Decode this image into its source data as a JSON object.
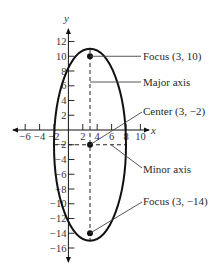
{
  "diagram": {
    "type": "ellipse-graph",
    "axes": {
      "x_label": "x",
      "y_label": "y",
      "x_ticks": [
        {
          "value": -6,
          "label": "−6"
        },
        {
          "value": -4,
          "label": "−4"
        },
        {
          "value": -2,
          "label": "−2"
        },
        {
          "value": 2,
          "label": "2"
        },
        {
          "value": 4,
          "label": "4"
        },
        {
          "value": 6,
          "label": "6"
        },
        {
          "value": 8,
          "label": "8"
        },
        {
          "value": 10,
          "label": "10"
        }
      ],
      "y_ticks": [
        {
          "value": 12,
          "label": "12"
        },
        {
          "value": 10,
          "label": "10"
        },
        {
          "value": 8,
          "label": "8"
        },
        {
          "value": 6,
          "label": "6"
        },
        {
          "value": 4,
          "label": "4"
        },
        {
          "value": 2,
          "label": "2"
        },
        {
          "value": -2,
          "label": "−2"
        },
        {
          "value": -4,
          "label": "−4"
        },
        {
          "value": -6,
          "label": "−6"
        },
        {
          "value": -8,
          "label": "−8"
        },
        {
          "value": -10,
          "label": "−10"
        },
        {
          "value": -12,
          "label": "−12"
        },
        {
          "value": -14,
          "label": "−14"
        },
        {
          "value": -16,
          "label": "−16"
        }
      ]
    },
    "ellipse": {
      "center": {
        "x": 3,
        "y": -2
      },
      "semi_major": 13,
      "semi_minor": 5,
      "orientation": "vertical"
    },
    "points": [
      {
        "name": "focus-top",
        "x": 3,
        "y": 10
      },
      {
        "name": "center",
        "x": 3,
        "y": -2
      },
      {
        "name": "focus-bottom",
        "x": 3,
        "y": -14
      }
    ],
    "callouts": [
      {
        "id": "focus-top",
        "label": "Focus (3, 10)"
      },
      {
        "id": "major-axis",
        "label": "Major axis"
      },
      {
        "id": "center",
        "label": "Center (3, −2)"
      },
      {
        "id": "minor-axis",
        "label": "Minor axis"
      },
      {
        "id": "focus-bottom",
        "label": "Focus (3, −14)"
      }
    ],
    "colors": {
      "ink": "#111111",
      "leader": "#444444",
      "text": "#2a2a2a"
    }
  }
}
